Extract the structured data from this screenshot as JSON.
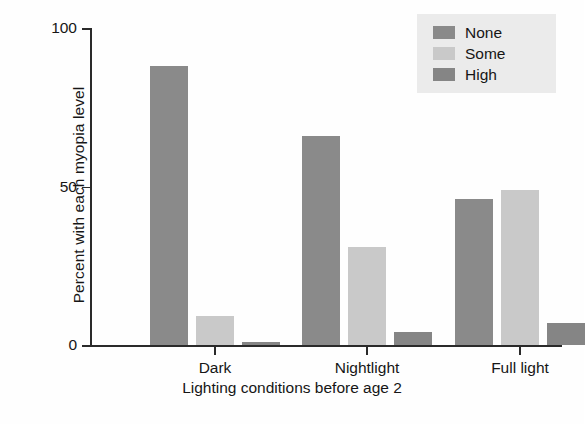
{
  "chart_data": {
    "type": "bar",
    "title": "",
    "subtitle": "",
    "xlabel": "Lighting conditions before age 2",
    "ylabel": "Percent with each myopia level",
    "categories": [
      "Dark",
      "Nightlight",
      "Full light"
    ],
    "series": [
      {
        "name": "None",
        "color": "#8a8a8a",
        "values": [
          88,
          66,
          46
        ]
      },
      {
        "name": "Some",
        "color": "#c9c9c9",
        "values": [
          9,
          31,
          49
        ]
      },
      {
        "name": "High",
        "color": "#858585",
        "values": [
          1,
          4,
          7
        ]
      }
    ],
    "ylim": [
      0,
      100
    ],
    "yticks": [
      0,
      50,
      100
    ],
    "ytick_labels": [
      "0",
      "50",
      "100"
    ],
    "grid": false,
    "legend_position": "top-right",
    "legend_entries": [
      "None",
      "Some",
      "High"
    ]
  },
  "axes": {
    "y_title": "Percent with each myopia level",
    "x_title": "Lighting conditions before age 2",
    "y_ticks": [
      {
        "label": "100",
        "value": 100
      },
      {
        "label": "50",
        "value": 50
      },
      {
        "label": "0",
        "value": 0
      }
    ],
    "x_ticks": [
      {
        "label": "Dark"
      },
      {
        "label": "Nightlight"
      },
      {
        "label": "Full light"
      }
    ]
  },
  "legend": {
    "background": "#ebebeb",
    "items": [
      {
        "label": "None",
        "color": "#8a8a8a"
      },
      {
        "label": "Some",
        "color": "#c9c9c9"
      },
      {
        "label": "High",
        "color": "#858585"
      }
    ]
  },
  "colors": {
    "axis": "#2a2a2a",
    "text": "#161616",
    "background": "#ffffff",
    "none": "#8a8a8a",
    "some": "#c9c9c9",
    "high": "#858585"
  }
}
